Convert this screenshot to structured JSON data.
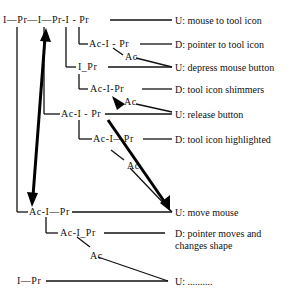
{
  "nodes": {
    "n0": "I—Pr—I—Pr-I - Pr",
    "n1": "Ac-I - Pr",
    "n1ac": "Ac",
    "n2": "I_Pr",
    "n3": "Ac-I-Pr",
    "n3ac": "Ac",
    "n4": "Ac-I - Pr",
    "n5": "Ac-I—Pr",
    "n5ac": "Ac",
    "n6": "Ac-I—Pr",
    "n7": "Ac-I_Pr",
    "n7ac": "Ac",
    "n8": "I—Pr"
  },
  "labels": {
    "l0": "U: mouse to tool icon",
    "l1": "D: pointer to tool icon",
    "l2": "U: depress mouse button",
    "l3": "D: tool icon shimmers",
    "l4": "U: release button",
    "l5": "D: tool icon highlighted",
    "l6": "U: move mouse",
    "l7a": "D: pointer moves and",
    "l7b": "changes shape",
    "l8": "U: .........."
  }
}
